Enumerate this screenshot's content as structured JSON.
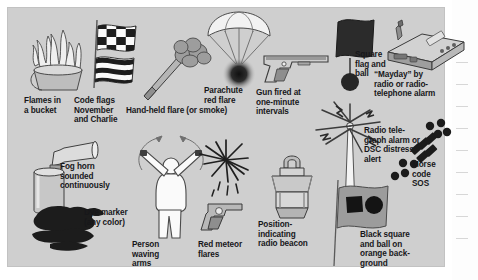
{
  "figure": {
    "background_color": "#cfcfcf",
    "page_color": "#ffffff",
    "text_color": "#17171a"
  },
  "signals": [
    {
      "id": "flames-in-a-bucket",
      "label": "Flames in\na bucket",
      "icon": "flames-bucket-icon"
    },
    {
      "id": "code-flags-november-charlie",
      "label": "Code flags\nNovember\nand Charlie",
      "icon": "code-flags-icon"
    },
    {
      "id": "hand-held-flare",
      "label": "Hand-held flare (or smoke)",
      "icon": "hand-held-flare-icon"
    },
    {
      "id": "parachute-red-flare",
      "label": "Parachute\nred flare",
      "icon": "parachute-flare-icon"
    },
    {
      "id": "gun-fired-intervals",
      "label": "Gun fired at\none-minute\nintervals",
      "icon": "signal-gun-icon"
    },
    {
      "id": "square-flag-and-ball",
      "label": "Square\nflag and\nball",
      "icon": "flag-and-ball-icon"
    },
    {
      "id": "mayday-radio",
      "label": "“Mayday” by\nradio or radio-\ntelephone alarm",
      "icon": "vhf-radio-icon"
    },
    {
      "id": "fog-horn",
      "label": "Fog horn\nsounded\ncontinuously",
      "icon": "fog-horn-icon"
    },
    {
      "id": "dye-marker",
      "label": "Dye marker\n(any color)",
      "icon": "dye-marker-icon"
    },
    {
      "id": "person-waving-arms",
      "label": "Person\nwaving\narms",
      "icon": "person-waving-icon"
    },
    {
      "id": "red-meteor-flares",
      "label": "Red meteor\nflares",
      "icon": "meteor-flare-gun-icon"
    },
    {
      "id": "epirb",
      "label": "Position-\nindicating\nradio beacon",
      "icon": "epirb-icon"
    },
    {
      "id": "radiotelegraph-alarm",
      "label": "Radio tele-\ngraph alarm or\nDSC distress\nalert",
      "icon": "antenna-transmit-icon"
    },
    {
      "id": "morse-code-sos",
      "label": "Morse\ncode\nSOS",
      "icon": "morse-sos-icon"
    },
    {
      "id": "black-square-and-ball",
      "label": "Black square\nand ball on\norange back-\nground",
      "icon": "distress-flag-icon"
    }
  ]
}
